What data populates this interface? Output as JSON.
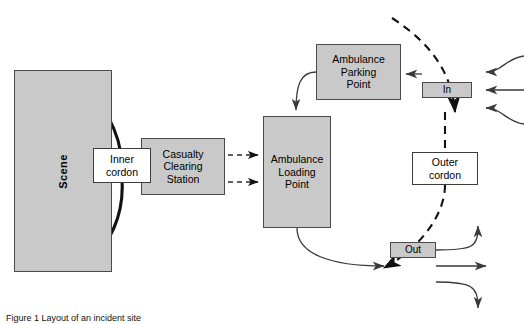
{
  "diagram": {
    "caption": "Figure 1 Layout of an incident site",
    "colors": {
      "node_fill": "#c9c9c9",
      "node_stroke": "#4a4a4a",
      "white_fill": "#ffffff",
      "line": "#333333",
      "background": "#ffffff"
    },
    "nodes": [
      {
        "id": "scene",
        "label": "Scene",
        "shape": "rect",
        "fill": "gray",
        "orientation": "vertical"
      },
      {
        "id": "inner_cordon",
        "label": "Inner\ncordon",
        "shape": "rect",
        "fill": "white",
        "orientation": "horizontal"
      },
      {
        "id": "ccs",
        "label": "Casualty\nClearing\nStation",
        "shape": "rect",
        "fill": "gray",
        "orientation": "horizontal"
      },
      {
        "id": "alp",
        "label": "Ambulance\nLoading\nPoint",
        "shape": "rect",
        "fill": "gray",
        "orientation": "horizontal"
      },
      {
        "id": "app",
        "label": "Ambulance\nParking\nPoint",
        "shape": "rect",
        "fill": "gray",
        "orientation": "horizontal"
      },
      {
        "id": "in_gate",
        "label": "In",
        "shape": "rect",
        "fill": "gray",
        "orientation": "horizontal"
      },
      {
        "id": "out_gate",
        "label": "Out",
        "shape": "rect",
        "fill": "gray",
        "orientation": "horizontal"
      },
      {
        "id": "outer_cordon",
        "label": "Outer\ncordon",
        "shape": "rect",
        "fill": "white",
        "orientation": "horizontal"
      }
    ],
    "edges": [
      {
        "id": "inner-cordon-arc-top",
        "from": "inner_cordon",
        "to": "scene",
        "style": "solid-thick-curved",
        "label": ""
      },
      {
        "id": "inner-cordon-arc-bottom",
        "from": "inner_cordon",
        "to": "scene",
        "style": "solid-thick-curved",
        "label": ""
      },
      {
        "id": "ccs-to-alp-upper",
        "from": "ccs",
        "to": "alp",
        "style": "dashed",
        "label": ""
      },
      {
        "id": "ccs-to-alp-lower",
        "from": "ccs",
        "to": "alp",
        "style": "dashed",
        "label": ""
      },
      {
        "id": "app-to-alp",
        "from": "app",
        "to": "alp",
        "style": "solid-curved",
        "label": ""
      },
      {
        "id": "in-to-app",
        "from": "in_gate",
        "to": "app",
        "style": "solid",
        "label": ""
      },
      {
        "id": "alp-to-out",
        "from": "alp",
        "to": "out_gate",
        "style": "solid-curved",
        "label": ""
      },
      {
        "id": "outer-cordon-boundary",
        "from": "outer_cordon",
        "to": "",
        "style": "dashed-arc",
        "label": ""
      },
      {
        "id": "inbound-traffic-upper",
        "from": "",
        "to": "in_gate",
        "style": "solid-curved",
        "label": ""
      },
      {
        "id": "inbound-traffic-middle",
        "from": "",
        "to": "in_gate",
        "style": "solid",
        "label": ""
      },
      {
        "id": "inbound-traffic-lower",
        "from": "",
        "to": "in_gate",
        "style": "solid-curved",
        "label": ""
      },
      {
        "id": "outbound-traffic-upper",
        "from": "out_gate",
        "to": "",
        "style": "solid-curved",
        "label": ""
      },
      {
        "id": "outbound-traffic-middle",
        "from": "out_gate",
        "to": "",
        "style": "solid",
        "label": ""
      },
      {
        "id": "outbound-traffic-lower",
        "from": "out_gate",
        "to": "",
        "style": "solid-curved",
        "label": ""
      }
    ]
  }
}
